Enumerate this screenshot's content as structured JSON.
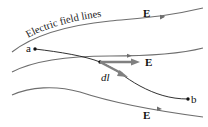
{
  "diagram": {
    "title_label": "Electric field lines",
    "field_label": "E",
    "point_a": "a",
    "point_b": "b",
    "displacement_label": "dl",
    "colors": {
      "field_line": "#6e6e6e",
      "path": "#1a1a1a",
      "vector": "#808080",
      "text": "#111111"
    },
    "field_lines": [
      {
        "name": "top",
        "e_label": "E"
      },
      {
        "name": "middle",
        "e_label": "E"
      },
      {
        "name": "bottom",
        "e_label": "E"
      }
    ]
  }
}
